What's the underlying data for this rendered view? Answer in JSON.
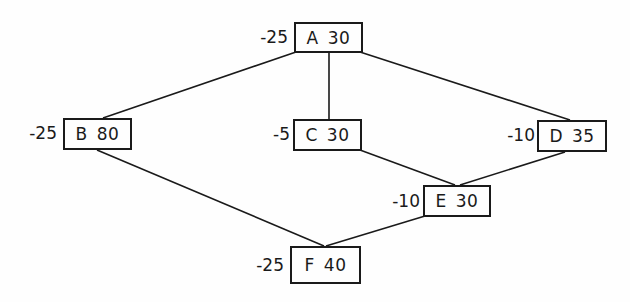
{
  "diagram": {
    "type": "network-graph",
    "nodes": [
      {
        "id": "A",
        "value": "30",
        "weight": "-25"
      },
      {
        "id": "B",
        "value": "80",
        "weight": "-25"
      },
      {
        "id": "C",
        "value": "30",
        "weight": "-5"
      },
      {
        "id": "D",
        "value": "35",
        "weight": "-10"
      },
      {
        "id": "E",
        "value": "30",
        "weight": "-10"
      },
      {
        "id": "F",
        "value": "40",
        "weight": "-25"
      }
    ],
    "edges": [
      {
        "from": "A",
        "to": "B"
      },
      {
        "from": "A",
        "to": "C"
      },
      {
        "from": "A",
        "to": "D"
      },
      {
        "from": "C",
        "to": "E"
      },
      {
        "from": "D",
        "to": "E"
      },
      {
        "from": "B",
        "to": "F"
      },
      {
        "from": "E",
        "to": "F"
      }
    ],
    "colors": {
      "line": "#1a1a1a",
      "background": "#fefefe"
    }
  }
}
